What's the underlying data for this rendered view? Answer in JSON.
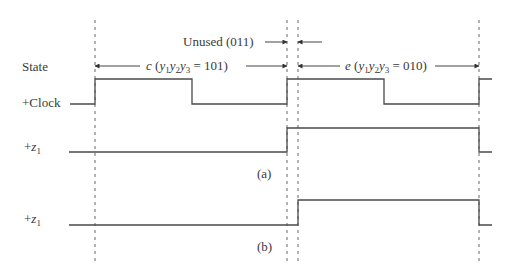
{
  "figure": {
    "kind": "timing-diagram",
    "colors": {
      "wave": "#4a4a4a",
      "dash": "#555555",
      "text": "#3a3a3a",
      "background": "#ffffff"
    }
  },
  "signals": [
    {
      "id": "state",
      "label": "State"
    },
    {
      "id": "clock",
      "label_prefix": "+",
      "label": "Clock"
    },
    {
      "id": "z1a",
      "label_prefix": "+",
      "label_var": "z",
      "label_sub": "1",
      "caption": "(a)"
    },
    {
      "id": "z1b",
      "label_prefix": "+",
      "label_var": "z",
      "label_sub": "1",
      "caption": "(b)"
    }
  ],
  "annotations": {
    "unused": {
      "text": "Unused (011)"
    },
    "state_c": {
      "letter": "c",
      "open": " (",
      "vars": [
        "y",
        "1",
        "y",
        "2",
        "y",
        "3"
      ],
      "value": " = 101)"
    },
    "state_e": {
      "letter": "e",
      "open": " (",
      "vars": [
        "y",
        "1",
        "y",
        "2",
        "y",
        "3"
      ],
      "value": " = 010)"
    }
  },
  "captions": {
    "a": "(a)",
    "b": "(b)"
  },
  "geometry": {
    "dashed_x": [
      95,
      287,
      298,
      479
    ],
    "dash_top": 20,
    "dash_bottom": 262,
    "clock": {
      "high_y": 79,
      "low_y": 104,
      "points": [
        [
          97,
          104
        ],
        [
          95,
          104
        ],
        [
          95,
          79
        ],
        [
          192,
          79
        ],
        [
          192,
          104
        ],
        [
          287,
          104
        ],
        [
          287,
          79
        ],
        [
          384,
          79
        ],
        [
          384,
          104
        ],
        [
          479,
          104
        ],
        [
          479,
          79
        ],
        [
          492,
          79
        ]
      ],
      "start_x": 70
    },
    "z1a": {
      "high_y": 128,
      "low_y": 152,
      "points": [
        [
          69,
          152
        ],
        [
          287,
          152
        ],
        [
          287,
          128
        ],
        [
          479,
          128
        ],
        [
          479,
          152
        ],
        [
          492,
          152
        ]
      ]
    },
    "z1b": {
      "high_y": 200,
      "low_y": 225,
      "points": [
        [
          69,
          225
        ],
        [
          298,
          225
        ],
        [
          298,
          200
        ],
        [
          479,
          200
        ],
        [
          479,
          225
        ],
        [
          492,
          225
        ]
      ]
    },
    "arrows": {
      "unused_right": {
        "from": [
          265,
          42
        ],
        "to": [
          287,
          42
        ]
      },
      "unused_left": {
        "from": [
          322,
          42
        ],
        "to": [
          298,
          42
        ]
      },
      "c_left": {
        "from": [
          140,
          66
        ],
        "to": [
          95,
          66
        ]
      },
      "c_right": {
        "from": [
          246,
          66
        ],
        "to": [
          287,
          66
        ]
      },
      "e_left": {
        "from": [
          340,
          66
        ],
        "to": [
          298,
          66
        ]
      },
      "e_right": {
        "from": [
          435,
          66
        ],
        "to": [
          479,
          66
        ]
      }
    }
  }
}
